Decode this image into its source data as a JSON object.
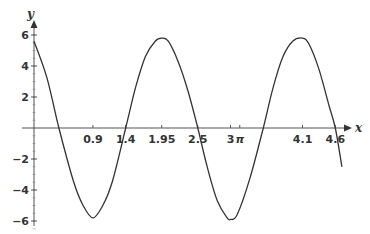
{
  "chart_data": {
    "type": "line",
    "title": "",
    "xlabel": "x",
    "ylabel": "y",
    "xlim": [
      0,
      4.9
    ],
    "ylim": [
      -6.3,
      6.5
    ],
    "grid": false,
    "legend": null,
    "x_ticks": [
      {
        "value": 0.9,
        "label": "0.9"
      },
      {
        "value": 1.4,
        "label": "1.4"
      },
      {
        "value": 1.95,
        "label": "1.95"
      },
      {
        "value": 2.5,
        "label": "2.5"
      },
      {
        "value": 3.0,
        "label": "3"
      },
      {
        "value": 3.14159,
        "label": "π"
      },
      {
        "value": 4.1,
        "label": "4.1"
      },
      {
        "value": 4.6,
        "label": "4.6"
      }
    ],
    "y_ticks": [
      {
        "value": 6,
        "label": "6"
      },
      {
        "value": 4,
        "label": "4"
      },
      {
        "value": 2,
        "label": "2"
      },
      {
        "value": -2,
        "label": "−2"
      },
      {
        "value": -4,
        "label": "−4"
      },
      {
        "value": -6,
        "label": "−6"
      }
    ],
    "series": [
      {
        "name": "curve",
        "color": "#333333",
        "x": [
          0,
          0.2,
          0.38,
          0.6,
          0.75,
          0.9,
          1.05,
          1.2,
          1.4,
          1.55,
          1.7,
          1.85,
          1.95,
          2.05,
          2.2,
          2.35,
          2.5,
          2.65,
          2.8,
          2.95,
          3.0,
          3.1,
          3.3,
          3.5,
          3.65,
          3.8,
          3.95,
          4.1,
          4.2,
          4.35,
          4.5,
          4.6,
          4.7
        ],
        "y": [
          5.6,
          3.2,
          0,
          -3.4,
          -5.0,
          -5.8,
          -5.0,
          -3.4,
          0,
          2.6,
          4.6,
          5.6,
          5.8,
          5.6,
          4.3,
          2.4,
          0,
          -2.6,
          -4.7,
          -5.8,
          -5.9,
          -5.6,
          -3.2,
          0,
          2.6,
          4.6,
          5.6,
          5.8,
          5.4,
          3.8,
          1.5,
          0,
          -2.5
        ]
      }
    ]
  },
  "plot": {
    "origin_px": [
      34,
      128
    ],
    "x_scale_px": 65.5,
    "y_scale_px": 15.5,
    "x_axis_end_px": 352,
    "y_axis_top_px": 20,
    "y_axis_bottom_px": 226
  }
}
